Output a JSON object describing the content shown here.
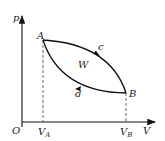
{
  "diagram": {
    "type": "p-V cycle diagram",
    "axes": {
      "y_label": "p",
      "x_label": "V",
      "origin_label": "O"
    },
    "points": [
      {
        "name": "A",
        "label": "A"
      },
      {
        "name": "B",
        "label": "B"
      }
    ],
    "curves": [
      {
        "name": "c",
        "label": "c",
        "direction": "A to B",
        "position": "upper"
      },
      {
        "name": "d",
        "label": "d",
        "direction": "B to A",
        "position": "lower"
      }
    ],
    "area_label": "W",
    "x_ticks": [
      {
        "main": "V",
        "sub": "A"
      },
      {
        "main": "V",
        "sub": "B"
      }
    ]
  }
}
